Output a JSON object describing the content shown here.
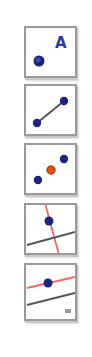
{
  "toolbar": {
    "tools": [
      {
        "id": "point",
        "icon": "point-with-label-icon",
        "label_text": "A"
      },
      {
        "id": "segment",
        "icon": "segment-icon"
      },
      {
        "id": "midpoint",
        "icon": "midpoint-icon"
      },
      {
        "id": "perpendicular-line",
        "icon": "perpendicular-line-icon"
      },
      {
        "id": "parallel-line",
        "icon": "parallel-line-icon"
      }
    ],
    "colors": {
      "point": "#1a237e",
      "point_highlight": "#3949ab",
      "midpoint": "#e65100",
      "line": "#555555",
      "accent_line": "#f06a5a",
      "label": "#2b3a9a",
      "border": "#9a9a9a"
    }
  }
}
